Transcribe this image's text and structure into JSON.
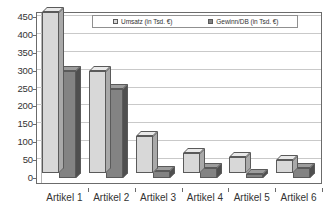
{
  "chart_data": {
    "type": "bar",
    "title": "",
    "subtitle": "",
    "xlabel": "",
    "ylabel": "",
    "categories": [
      "Artikel 1",
      "Artikel 2",
      "Artikel 3",
      "Artikel 4",
      "Artikel 5",
      "Artikel 6"
    ],
    "series": [
      {
        "name": "Umsatz (in Tsd. €)",
        "color": "#d8d8d8",
        "values": [
          450,
          285,
          103,
          57,
          45,
          35
        ]
      },
      {
        "name": "Gewinn/DB (in Tsd. €)",
        "color": "#838383",
        "values": [
          300,
          248,
          20,
          28,
          12,
          27
        ]
      }
    ],
    "ylim": [
      0,
      450
    ],
    "y_ticks": [
      0,
      50,
      100,
      150,
      200,
      250,
      300,
      350,
      400,
      450
    ],
    "y_tick_labels": [
      "0",
      "50",
      "100",
      "150",
      "200",
      "250",
      "300",
      "350",
      "400",
      "450"
    ],
    "grid": true,
    "grid_axis": "y",
    "legend_position": "top-center",
    "style": "3d-clustered-column"
  },
  "legend": {
    "items": [
      {
        "label": "Umsatz (in Tsd. €)",
        "color": "#d8d8d8"
      },
      {
        "label": "Gewinn/DB (in Tsd. €)",
        "color": "#838383"
      }
    ]
  },
  "axes": {
    "y_tick_labels": [
      "450",
      "400",
      "350",
      "300",
      "250",
      "200",
      "150",
      "100",
      "50",
      "0"
    ],
    "x_tick_labels": [
      "Artikel 1",
      "Artikel 2",
      "Artikel 3",
      "Artikel 4",
      "Artikel 5",
      "Artikel 6"
    ]
  },
  "colors": {
    "series_umsatz": "#d8d8d8",
    "series_gewinn": "#838383",
    "gridline": "#c9c9c9",
    "axis": "#6b6b6b",
    "background": "#ffffff"
  }
}
